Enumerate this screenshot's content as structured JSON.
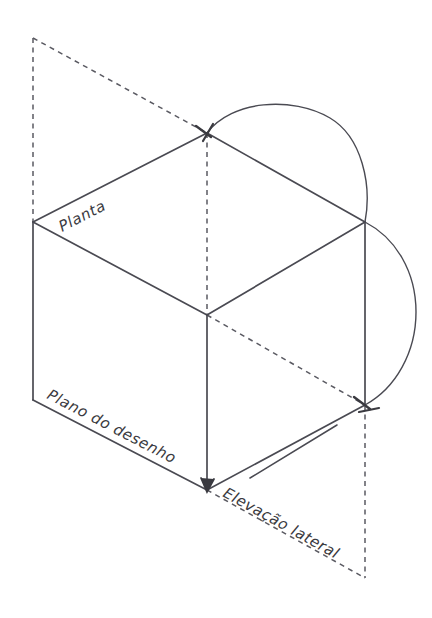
{
  "figure": {
    "background_color": "#ffffff",
    "line_color": "#4a4a52",
    "dash_color": "#5a5a62",
    "text_color": "#3a3a40",
    "width": 432,
    "height": 618
  },
  "labels": {
    "planta": "Planta",
    "plano_do_desenho": "Plano do desenho",
    "elevacao_lateral": "Elevação lateral"
  },
  "geometry": {
    "vertices": {
      "dashed_top_left": [
        33,
        38
      ],
      "left": [
        33,
        222
      ],
      "bottom_left": [
        33,
        400
      ],
      "top": [
        207,
        133
      ],
      "center": [
        207,
        315
      ],
      "bottom_center": [
        207,
        490
      ],
      "right": [
        365,
        222
      ],
      "bottom_right": [
        365,
        405
      ],
      "dashed_bottom_right": [
        365,
        578
      ]
    },
    "solid_edges": [
      [
        [
          33,
          222
        ],
        [
          207,
          133
        ]
      ],
      [
        [
          207,
          133
        ],
        [
          365,
          222
        ]
      ],
      [
        [
          33,
          222
        ],
        [
          207,
          315
        ]
      ],
      [
        [
          207,
          315
        ],
        [
          365,
          222
        ]
      ],
      [
        [
          33,
          222
        ],
        [
          33,
          400
        ]
      ],
      [
        [
          207,
          315
        ],
        [
          207,
          490
        ]
      ],
      [
        [
          365,
          222
        ],
        [
          365,
          405
        ]
      ],
      [
        [
          33,
          400
        ],
        [
          207,
          490
        ]
      ],
      [
        [
          207,
          490
        ],
        [
          365,
          405
        ]
      ]
    ],
    "dashed_edges": [
      [
        [
          33,
          38
        ],
        [
          33,
          222
        ]
      ],
      [
        [
          33,
          38
        ],
        [
          207,
          133
        ]
      ],
      [
        [
          207,
          133
        ],
        [
          207,
          315
        ]
      ],
      [
        [
          207,
          315
        ],
        [
          365,
          405
        ]
      ],
      [
        [
          365,
          405
        ],
        [
          365,
          578
        ]
      ],
      [
        [
          207,
          490
        ],
        [
          365,
          578
        ]
      ]
    ],
    "arcs": [
      {
        "from": [
          207,
          133
        ],
        "to": [
          365,
          222
        ],
        "peak": [
          292,
          110
        ]
      },
      {
        "from": [
          365,
          222
        ],
        "to": [
          365,
          405
        ],
        "peak": [
          416,
          312
        ]
      }
    ],
    "leader_line": [
      [
        250,
        478
      ],
      [
        337,
        425
      ]
    ],
    "arrowheads": [
      {
        "at": [
          207,
          133
        ],
        "direction": "down-right"
      },
      {
        "at": [
          365,
          405
        ],
        "direction": "down-right"
      },
      {
        "at": [
          207,
          490
        ],
        "direction": "down"
      }
    ]
  }
}
